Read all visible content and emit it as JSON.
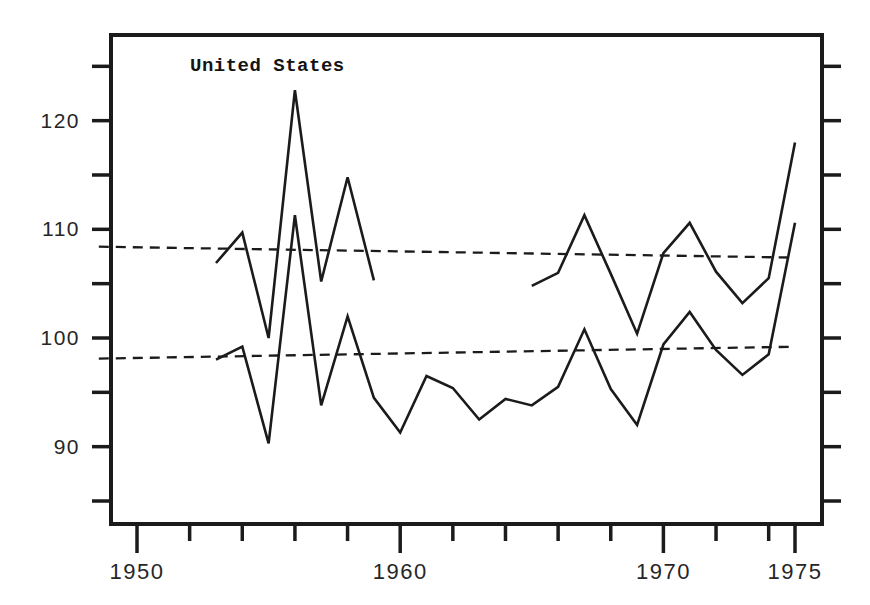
{
  "page": {
    "kind": "scanned line chart figure"
  },
  "chart_data": {
    "type": "line",
    "title": "United States",
    "xlabel": "",
    "ylabel": "",
    "grid": false,
    "legend": null,
    "ink_color": "#1b1b1b",
    "label_color": "#262626",
    "background_color": "#ffffff",
    "x_axis": {
      "range": [
        1948.5,
        1976.1
      ],
      "tick_years": [
        1950,
        1952,
        1954,
        1956,
        1958,
        1960,
        1962,
        1964,
        1966,
        1968,
        1970,
        1972,
        1974,
        1975
      ],
      "major_tick_years": [
        1950,
        1960,
        1970,
        1975
      ],
      "tick_labels": [
        "1950",
        "1960",
        "1970",
        "1975"
      ]
    },
    "y_axis": {
      "range": [
        82.8,
        127.9
      ],
      "tick_values": [
        85,
        90,
        95,
        100,
        105,
        110,
        115,
        120,
        125
      ],
      "labeled_values": [
        90,
        100,
        110,
        120
      ],
      "tick_labels": [
        "90",
        "100",
        "110",
        "120"
      ]
    },
    "series": [
      {
        "id": "upper-early",
        "name": "Upper index series, 1953-1959 segment",
        "style": "solid",
        "points": [
          [
            1953,
            106.9
          ],
          [
            1954,
            109.7
          ],
          [
            1955,
            100.0
          ],
          [
            1956,
            122.8
          ],
          [
            1957,
            105.2
          ],
          [
            1958,
            114.8
          ],
          [
            1959,
            105.3
          ]
        ]
      },
      {
        "id": "upper-late",
        "name": "Upper index series, 1965-1975 segment",
        "style": "solid",
        "points": [
          [
            1965,
            104.8
          ],
          [
            1966,
            106.0
          ],
          [
            1967,
            111.3
          ],
          [
            1968,
            105.9
          ],
          [
            1969,
            100.4
          ],
          [
            1970,
            107.8
          ],
          [
            1971,
            110.6
          ],
          [
            1972,
            106.1
          ],
          [
            1973,
            103.2
          ],
          [
            1974,
            105.5
          ],
          [
            1975,
            118.0
          ]
        ]
      },
      {
        "id": "lower",
        "name": "Lower index series, 1953-1975",
        "style": "solid",
        "points": [
          [
            1953,
            98.0
          ],
          [
            1954,
            99.2
          ],
          [
            1955,
            90.3
          ],
          [
            1956,
            111.3
          ],
          [
            1957,
            93.8
          ],
          [
            1958,
            102.0
          ],
          [
            1959,
            94.5
          ],
          [
            1960,
            91.3
          ],
          [
            1961,
            96.5
          ],
          [
            1962,
            95.4
          ],
          [
            1963,
            92.5
          ],
          [
            1964,
            94.4
          ],
          [
            1965,
            93.8
          ],
          [
            1966,
            95.5
          ],
          [
            1967,
            100.8
          ],
          [
            1968,
            95.3
          ],
          [
            1969,
            92.0
          ],
          [
            1970,
            99.4
          ],
          [
            1971,
            102.4
          ],
          [
            1972,
            98.9
          ],
          [
            1973,
            96.6
          ],
          [
            1974,
            98.5
          ],
          [
            1975,
            110.6
          ]
        ]
      },
      {
        "id": "upper-trend",
        "name": "Upper dashed trend line",
        "style": "dashed",
        "points": [
          [
            1948.55,
            108.4
          ],
          [
            1975,
            107.4
          ]
        ]
      },
      {
        "id": "lower-trend",
        "name": "Lower dashed trend line",
        "style": "dashed",
        "points": [
          [
            1948.55,
            98.1
          ],
          [
            1975,
            99.2
          ]
        ]
      }
    ]
  }
}
